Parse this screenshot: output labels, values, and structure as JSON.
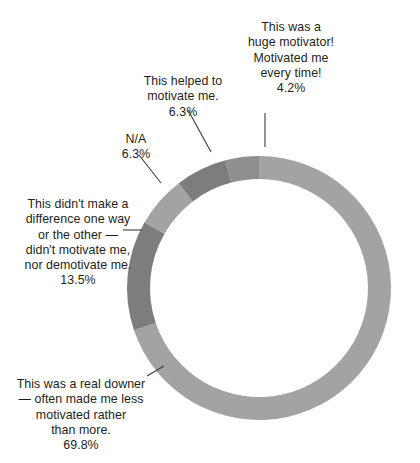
{
  "chart_data": {
    "type": "pie",
    "variant": "donut",
    "title": "",
    "subtitle": "",
    "xlabel": "",
    "ylabel": "",
    "legend_position": "none",
    "grid": false,
    "value_unit": "percent",
    "total": 100.1,
    "start_angle_deg": 0,
    "direction": "clockwise",
    "inner_radius_ratio": 0.826,
    "categories": [
      "This was a real downer — often made me less motivated rather than more.",
      "This didn't make a difference one way or the other — didn't motivate me, nor demotivate me.",
      "N/A",
      "This helped to motivate me.",
      "This was a huge motivator! Motivated me every time!"
    ],
    "values": [
      69.8,
      13.5,
      6.3,
      6.3,
      4.2
    ],
    "value_labels": [
      "69.8%",
      "13.5%",
      "6.3%",
      "6.3%",
      "4.2%"
    ],
    "colors": [
      "#a3a3a3",
      "#7d7d7d",
      "#a3a3a3",
      "#7d7d7d",
      "#8f8f8f"
    ],
    "slices": [
      {
        "name": "real-downer",
        "label": "This was a real downer\n— often made me less\nmotivated rather\nthan more.",
        "value": 69.8,
        "value_label": "69.8%",
        "color": "#a3a3a3",
        "start_deg": 0,
        "end_deg": 251.3
      },
      {
        "name": "no-difference",
        "label": "This didn't make a\ndifference one way\nor the other —\ndidn't motivate me,\nnor demotivate me.",
        "value": 13.5,
        "value_label": "13.5%",
        "color": "#7d7d7d",
        "start_deg": 251.3,
        "end_deg": 299.9
      },
      {
        "name": "na",
        "label": "N/A",
        "value": 6.3,
        "value_label": "6.3%",
        "color": "#a3a3a3",
        "start_deg": 299.9,
        "end_deg": 322.6
      },
      {
        "name": "helped-motivate",
        "label": "This helped to\nmotivate me.",
        "value": 6.3,
        "value_label": "6.3%",
        "color": "#7d7d7d",
        "start_deg": 322.6,
        "end_deg": 345.3
      },
      {
        "name": "huge-motivator",
        "label": "This was a\nhuge motivator!\nMotivated me\nevery time!",
        "value": 4.2,
        "value_label": "4.2%",
        "color": "#8f8f8f",
        "start_deg": 345.3,
        "end_deg": 360
      }
    ],
    "geometry": {
      "center_x": 259,
      "center_y": 288,
      "outer_radius": 132,
      "inner_radius": 109
    },
    "palette": {
      "light_gray": "#a3a3a3",
      "mid_gray": "#8f8f8f",
      "dark_gray": "#7d7d7d",
      "text": "#231f20",
      "leader_line": "#3b3b3b",
      "background": "#ffffff"
    }
  },
  "labels": {
    "huge_motivator": {
      "text": "This was a\nhuge motivator!\nMotivated me\nevery time!",
      "pct": "4.2%"
    },
    "helped_motivate": {
      "text": "This helped to\nmotivate me.",
      "pct": "6.3%"
    },
    "na": {
      "text": "N/A",
      "pct": "6.3%"
    },
    "no_difference": {
      "text": "This didn't make a\ndifference one way\nor the other —\ndidn't motivate me,\nnor demotivate me.",
      "pct": "13.5%"
    },
    "real_downer": {
      "text": "This was a real downer\n— often made me less\nmotivated rather\nthan more.",
      "pct": "69.8%"
    }
  }
}
